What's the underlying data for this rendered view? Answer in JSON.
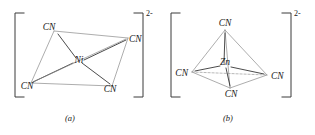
{
  "figure": {
    "kind": "chemistry-structure-pair",
    "background_color": "#ffffff",
    "ink_color": "#2b2b2b",
    "light_ink_color": "#8a8a8a"
  },
  "structures": [
    {
      "id": "a",
      "caption": "(a)",
      "charge": "2-",
      "geometry": "square planar",
      "center_atom": "Ni",
      "ligand_label": "CN",
      "ligands": [
        {
          "position": "top-left",
          "label": "CN"
        },
        {
          "position": "right",
          "label": "CN"
        },
        {
          "position": "bottom-left",
          "label": "CN"
        },
        {
          "position": "bottom-right",
          "label": "CN"
        }
      ]
    },
    {
      "id": "b",
      "caption": "(b)",
      "charge": "2-",
      "geometry": "tetrahedral",
      "center_atom": "Zn",
      "ligand_label": "CN",
      "ligands": [
        {
          "position": "top",
          "label": "CN"
        },
        {
          "position": "left",
          "label": "CN"
        },
        {
          "position": "right",
          "label": "CN"
        },
        {
          "position": "bottom-front",
          "label": "CN"
        }
      ]
    }
  ]
}
